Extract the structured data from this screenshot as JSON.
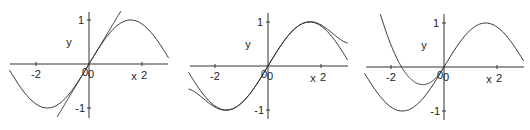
{
  "figure": {
    "panels": [
      {
        "id": "panel-tangent-line",
        "origin_px": [
          89,
          64
        ],
        "x_px_range": [
          10,
          168
        ],
        "y_axis_px_range": [
          12,
          118
        ],
        "labels": {
          "xlabel": "x",
          "ylabel": "y",
          "origin": "0",
          "origin2": "0"
        },
        "xticks": [
          {
            "value": -2,
            "label": "-2"
          },
          {
            "value": 2,
            "label": "2"
          }
        ],
        "yticks": [
          {
            "value": 1,
            "label": "1"
          },
          {
            "value": -1,
            "label": "-1"
          }
        ]
      },
      {
        "id": "panel-degree5-taylor",
        "origin_px": [
          268,
          66
        ],
        "x_px_range": [
          190,
          348
        ],
        "y_axis_px_range": [
          13,
          119
        ],
        "labels": {
          "xlabel": "x",
          "ylabel": "y",
          "origin": "0",
          "origin2": "0"
        },
        "xticks": [
          {
            "value": -2,
            "label": "-2"
          },
          {
            "value": 2,
            "label": "2"
          }
        ],
        "yticks": [
          {
            "value": 1,
            "label": "1"
          },
          {
            "value": -1,
            "label": "-1"
          }
        ]
      },
      {
        "id": "panel-quadratic-approx",
        "origin_px": [
          444,
          67
        ],
        "x_px_range": [
          366,
          524
        ],
        "y_axis_px_range": [
          14,
          120
        ],
        "labels": {
          "xlabel": "x",
          "ylabel": "y",
          "origin": "0",
          "origin2": "0"
        },
        "xticks": [
          {
            "value": -2,
            "label": "-2"
          },
          {
            "value": 2,
            "label": "2"
          }
        ],
        "yticks": [
          {
            "value": 1,
            "label": "1"
          },
          {
            "value": -1,
            "label": "-1"
          }
        ]
      }
    ]
  },
  "chart_data": [
    {
      "type": "line",
      "title": "",
      "xlabel": "x",
      "ylabel": "y",
      "xlim": [
        -3,
        3
      ],
      "ylim": [
        -1.2,
        1.2
      ],
      "xticks": [
        -2,
        2
      ],
      "yticks": [
        -1,
        1
      ],
      "grid": false,
      "legend": null,
      "series": [
        {
          "name": "sin(x)",
          "function": "sin(x)",
          "domain": [
            -3,
            3
          ],
          "x": [
            -3,
            -2,
            -1.5708,
            -1,
            0,
            1,
            1.5708,
            2,
            3
          ],
          "values": [
            -0.141,
            -0.909,
            -1.0,
            -0.841,
            0,
            0.841,
            1.0,
            0.909,
            0.141
          ]
        },
        {
          "name": "tangent line y = x",
          "function": "x",
          "domain": [
            -1.2,
            1.2
          ],
          "x": [
            -1.2,
            0,
            1.2
          ],
          "values": [
            -1.2,
            0,
            1.2
          ]
        }
      ]
    },
    {
      "type": "line",
      "title": "",
      "xlabel": "x",
      "ylabel": "y",
      "xlim": [
        -3,
        3
      ],
      "ylim": [
        -1.2,
        1.2
      ],
      "xticks": [
        -2,
        2
      ],
      "yticks": [
        -1,
        1
      ],
      "grid": false,
      "legend": null,
      "series": [
        {
          "name": "sin(x)",
          "function": "sin(x)",
          "domain": [
            -3,
            3
          ],
          "x": [
            -3,
            -2,
            -1.5708,
            -1,
            0,
            1,
            1.5708,
            2,
            3
          ],
          "values": [
            -0.141,
            -0.909,
            -1.0,
            -0.841,
            0,
            0.841,
            1.0,
            0.909,
            0.141
          ]
        },
        {
          "name": "Taylor polynomial x - x^3/6 + x^5/120",
          "function": "x - x^3/6 + x^5/120",
          "domain": [
            -3,
            3
          ],
          "x": [
            -3,
            -2,
            -1,
            0,
            1,
            2,
            3
          ],
          "values": [
            -0.525,
            -0.933,
            -0.842,
            0,
            0.842,
            0.933,
            0.525
          ]
        }
      ]
    },
    {
      "type": "line",
      "title": "",
      "xlabel": "x",
      "ylabel": "y",
      "xlim": [
        -3,
        3
      ],
      "ylim": [
        -1.2,
        1.2
      ],
      "xticks": [
        -2,
        2
      ],
      "yticks": [
        -1,
        1
      ],
      "grid": false,
      "legend": null,
      "series": [
        {
          "name": "sin(x)",
          "function": "sin(x)",
          "domain": [
            -3,
            3
          ],
          "x": [
            -3,
            -2,
            -1.5708,
            -1,
            0,
            1,
            1.5708,
            2,
            3
          ],
          "values": [
            -0.141,
            -0.909,
            -1.0,
            -0.841,
            0,
            0.841,
            1.0,
            0.909,
            0.141
          ]
        },
        {
          "name": "parabola through origin (approx. x + 0.625x^2)",
          "function": "x + 0.625*x^2",
          "domain": [
            -2.4,
            0
          ],
          "x": [
            -2.4,
            -2,
            -1.6,
            -1.2,
            -0.8,
            -0.4,
            0
          ],
          "values": [
            1.2,
            0.5,
            0.0,
            -0.3,
            -0.4,
            -0.3,
            0
          ]
        }
      ]
    }
  ]
}
